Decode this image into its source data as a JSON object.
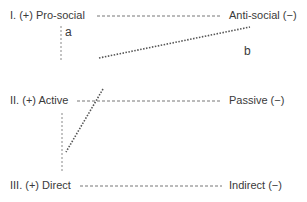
{
  "rows": [
    {
      "id": "I",
      "left": "I. (+) Pro-social",
      "right": "Anti-social (−)"
    },
    {
      "id": "II",
      "left": "II. (+) Active",
      "right": "Passive (−)"
    },
    {
      "id": "III",
      "left": "III. (+) Direct",
      "right": "Indirect (−)"
    }
  ],
  "annotations": {
    "a": "a",
    "b": "b"
  },
  "colors": {
    "line": "#777777",
    "text": "#3a3a3a",
    "background": "#ffffff"
  }
}
